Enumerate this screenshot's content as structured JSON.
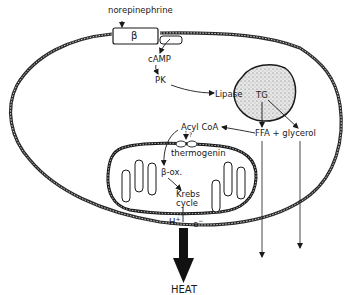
{
  "diagram": {
    "labels": {
      "norepinephrine": "norepinephrine",
      "receptor": "β",
      "camp": "cAMP",
      "pk": "PK",
      "lipase": "Lipase",
      "tg": "TG",
      "ffa_glycerol": "FFA + glycerol",
      "acyl_coa": "Acyl CoA",
      "question": "?",
      "thermogenin": "thermogenin",
      "beta_ox": "β-ox.",
      "krebs_line1": "Krebs",
      "krebs_line2": "cycle",
      "h_plus": "H",
      "h_plus_sup": "+",
      "e_minus": "e",
      "e_minus_sup": "−",
      "heat": "HEAT"
    },
    "colors": {
      "ink": "#1a1a1a",
      "membrane": "#2a2a2a",
      "droplet_fill": "#d9d9d9",
      "background": "#ffffff"
    }
  }
}
